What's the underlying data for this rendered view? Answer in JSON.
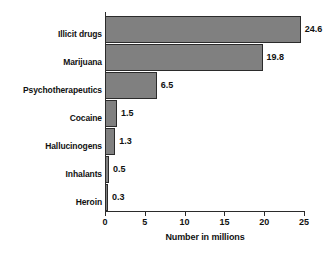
{
  "chart_data": {
    "type": "bar",
    "orientation": "horizontal",
    "title": "",
    "subtitle": "",
    "xlabel": "Number in millions",
    "ylabel": "",
    "xlim": [
      0,
      25
    ],
    "xticks": [
      0,
      5,
      10,
      15,
      20,
      25
    ],
    "xtick_labels": [
      "0",
      "5",
      "10",
      "15",
      "20",
      "25"
    ],
    "grid": false,
    "legend": null,
    "bar_color": "#808080",
    "bar_edge_color": "#2b2b2b",
    "axis_color": "#2b2b2b",
    "categories": [
      "Illicit drugs",
      "Marijuana",
      "Psychotherapeutics",
      "Cocaine",
      "Hallucinogens",
      "Inhalants",
      "Heroin"
    ],
    "values": [
      24.6,
      19.8,
      6.5,
      1.5,
      1.3,
      0.5,
      0.3
    ],
    "value_labels": [
      "24.6",
      "19.8",
      "6.5",
      "1.5",
      "1.3",
      "0.5",
      "0.3"
    ]
  }
}
